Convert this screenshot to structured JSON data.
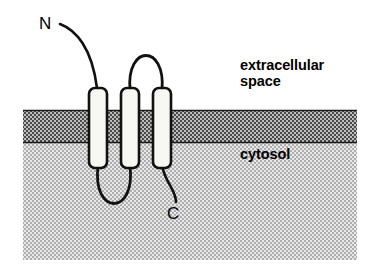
{
  "figure": {
    "width": 374,
    "height": 267,
    "background_color": "#ffffff"
  },
  "labels": {
    "extracellular": "extracellular\nspace",
    "extracellular_line1": "extracellular",
    "extracellular_line2": "space",
    "cytosol": "cytosol",
    "n_terminus": "N",
    "c_terminus": "C"
  },
  "regions": {
    "extracellular_space": {
      "name": "extracellular space",
      "fill": "#ffffff",
      "top": 0,
      "bottom": 110
    },
    "membrane": {
      "name": "lipid bilayer membrane",
      "pattern": "dark stipple",
      "fill": "#8a8a8a",
      "top": 110,
      "bottom": 143,
      "left": 23,
      "right": 357
    },
    "cytosol": {
      "name": "cytosol",
      "pattern": "light stipple",
      "fill": "#c9c9c9",
      "top": 143,
      "bottom": 260,
      "left": 23,
      "right": 357
    }
  },
  "helices": [
    {
      "name": "helix-1",
      "x": 89,
      "y": 88,
      "width": 18,
      "height": 80,
      "fill": "#f7f7f3",
      "stroke": "#111111"
    },
    {
      "name": "helix-2",
      "x": 121,
      "y": 88,
      "width": 18,
      "height": 80,
      "fill": "#f7f7f3",
      "stroke": "#111111"
    },
    {
      "name": "helix-3",
      "x": 153,
      "y": 88,
      "width": 18,
      "height": 80,
      "fill": "#f7f7f3",
      "stroke": "#111111"
    }
  ],
  "connectors": [
    {
      "name": "n-terminal-tail",
      "side": "extracellular",
      "from": "N label",
      "to": "helix-1"
    },
    {
      "name": "extracellular-loop",
      "side": "extracellular",
      "from": "helix-2",
      "to": "helix-3"
    },
    {
      "name": "cytosolic-loop",
      "side": "cytosol",
      "from": "helix-1",
      "to": "helix-2"
    },
    {
      "name": "c-terminal-tail",
      "side": "cytosol",
      "from": "helix-3",
      "to": "C label"
    }
  ],
  "colors": {
    "ink": "#000000",
    "helix_fill": "#f7f7f3",
    "membrane": "#8a8a8a",
    "cytosol": "#c9c9c9",
    "background": "#ffffff"
  }
}
